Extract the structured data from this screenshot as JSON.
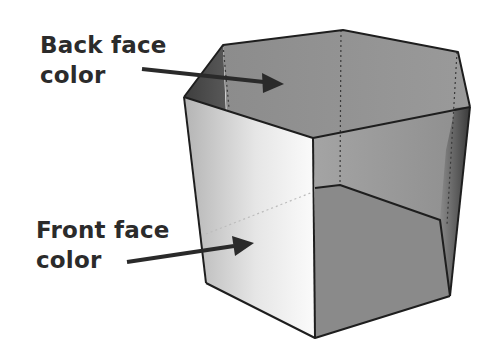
{
  "diagram": {
    "labels": {
      "back_face": {
        "line1": "Back face",
        "line2": "color"
      },
      "front_face": {
        "line1": "Front face",
        "line2": "color"
      }
    },
    "colors": {
      "text": "#2b2b2b",
      "arrow": "#2a2a2a",
      "edge": "#1e1e1e",
      "back_face": "#8f8f8f",
      "front_face_light": "#f2f2f2",
      "front_face_dark": "#a8a8a8",
      "interior_floor": "#8a8a8a",
      "interior_wall": "#9c9c9c",
      "shadow_side": "#555555"
    }
  }
}
